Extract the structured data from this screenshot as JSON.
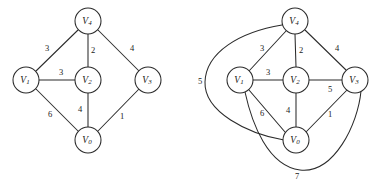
{
  "figure": {
    "background_color": "#ffffff",
    "stroke_color": "#2b2b2b",
    "text_color": "#1a1a1a"
  },
  "graphs": [
    {
      "id": "left-graph",
      "name": "minimum-spanning-tree-graph",
      "nodes": [
        {
          "id": "V4",
          "label": "V",
          "sub": "4",
          "cx": 88,
          "cy": 21,
          "r": 13
        },
        {
          "id": "V1",
          "label": "V",
          "sub": "1",
          "cx": 26,
          "cy": 80,
          "r": 13
        },
        {
          "id": "V2",
          "label": "V",
          "sub": "2",
          "cx": 88,
          "cy": 80,
          "r": 13
        },
        {
          "id": "V3",
          "label": "V",
          "sub": "3",
          "cx": 148,
          "cy": 80,
          "r": 13
        },
        {
          "id": "V0",
          "label": "V",
          "sub": "0",
          "cx": 88,
          "cy": 140,
          "r": 13
        }
      ],
      "edges": [
        {
          "from": "V1",
          "to": "V4",
          "weight": "3",
          "lx": 47,
          "ly": 48
        },
        {
          "from": "V4",
          "to": "V2",
          "weight": "2",
          "lx": 93,
          "ly": 50
        },
        {
          "from": "V4",
          "to": "V3",
          "weight": "4",
          "lx": 132,
          "ly": 48
        },
        {
          "from": "V1",
          "to": "V2",
          "weight": "3",
          "lx": 61,
          "ly": 72
        },
        {
          "from": "V1",
          "to": "V0",
          "weight": "6",
          "lx": 50,
          "ly": 114
        },
        {
          "from": "V2",
          "to": "V0",
          "weight": "4",
          "lx": 80,
          "ly": 109
        },
        {
          "from": "V0",
          "to": "V3",
          "weight": "1",
          "lx": 122,
          "ly": 116
        }
      ]
    },
    {
      "id": "right-graph",
      "name": "full-weighted-graph",
      "nodes": [
        {
          "id": "V4",
          "label": "V",
          "sub": "4",
          "cx": 295,
          "cy": 21,
          "r": 13
        },
        {
          "id": "V1",
          "label": "V",
          "sub": "1",
          "cx": 240,
          "cy": 80,
          "r": 13
        },
        {
          "id": "V2",
          "label": "V",
          "sub": "2",
          "cx": 296,
          "cy": 80,
          "r": 13
        },
        {
          "id": "V3",
          "label": "V",
          "sub": "3",
          "cx": 355,
          "cy": 80,
          "r": 13
        },
        {
          "id": "V0",
          "label": "V",
          "sub": "0",
          "cx": 296,
          "cy": 140,
          "r": 13
        }
      ],
      "edges": [
        {
          "from": "V1",
          "to": "V4",
          "weight": "3",
          "lx": 262,
          "ly": 48
        },
        {
          "from": "V4",
          "to": "V2",
          "weight": "2",
          "lx": 301,
          "ly": 50
        },
        {
          "from": "V4",
          "to": "V3",
          "weight": "4",
          "lx": 337,
          "ly": 48
        },
        {
          "from": "V1",
          "to": "V2",
          "weight": "3",
          "lx": 268,
          "ly": 72
        },
        {
          "from": "V2",
          "to": "V3",
          "weight": "5",
          "lx": 330,
          "ly": 89
        },
        {
          "from": "V1",
          "to": "V0",
          "weight": "6",
          "lx": 262,
          "ly": 113
        },
        {
          "from": "V2",
          "to": "V0",
          "weight": "4",
          "lx": 288,
          "ly": 110
        },
        {
          "from": "V0",
          "to": "V3",
          "weight": "1",
          "lx": 330,
          "ly": 114
        },
        {
          "from": "V4",
          "to": "V0",
          "weight": "5",
          "lx": 200,
          "ly": 81,
          "curved": true
        },
        {
          "from": "V1",
          "to": "V3",
          "weight": "7",
          "lx": 297,
          "ly": 176,
          "curved": true
        }
      ]
    }
  ]
}
